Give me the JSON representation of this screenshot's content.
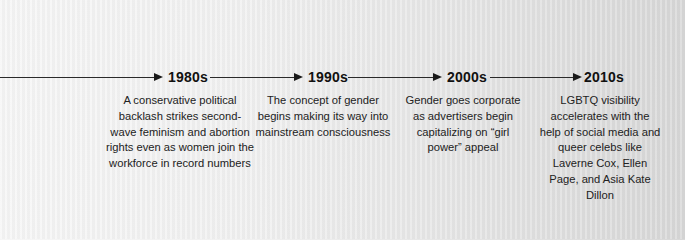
{
  "timeline": {
    "line_color": "#2a2a2a",
    "text_color": "#222222",
    "items": [
      {
        "era": "1980s",
        "description": "A conservative political backlash strikes second-wave feminism and abortion rights even as women join the workforce in record numbers"
      },
      {
        "era": "1990s",
        "description": "The concept of gender begins making its way into mainstream consciousness"
      },
      {
        "era": "2000s",
        "description": "Gender goes corporate as advertisers begin capitalizing on “girl power” appeal"
      },
      {
        "era": "2010s",
        "description": "LGBTQ visibility accelerates with the help of social media and queer celebs like Laverne Cox, Ellen Page, and Asia Kate Dillon"
      }
    ]
  }
}
